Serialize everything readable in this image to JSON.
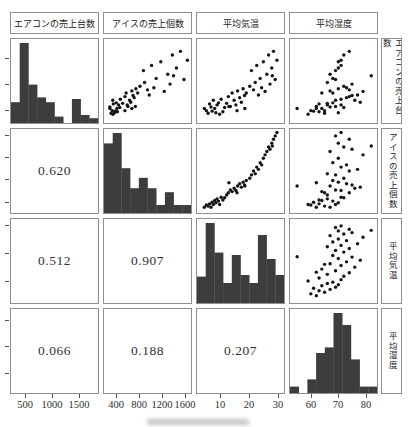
{
  "figure": {
    "background": "#ffffff",
    "border_color": "#8f8f8f",
    "bar_color": "#3d3d3d",
    "point_color": "#151515",
    "text_color": "#2e2e2e"
  },
  "chart_data": {
    "type": "scatter-matrix",
    "description_layout": "4x4 pairs plot: diagonal = histograms, upper triangle = scatter plots, lower triangle = correlation coefficients; column titles boxed on top, row titles boxed on right (vertical text), tick labels on bottom and left ticks",
    "variables": [
      {
        "key": "aircon",
        "label": "エアコンの売上台数",
        "lim": [
          300,
          1800
        ],
        "ticks": [
          500,
          1000,
          1500
        ],
        "hist": [
          0.26,
          1.0,
          0.48,
          0.32,
          0.26,
          0.08,
          0,
          0.3,
          0.1,
          0.06
        ]
      },
      {
        "key": "ice",
        "label": "アイスの売上個数",
        "lim": [
          250,
          1650
        ],
        "ticks": [
          400,
          800,
          1200,
          1600
        ],
        "hist": [
          0.87,
          1.0,
          0.56,
          0.31,
          0.44,
          0.31,
          0.1,
          0.26,
          0.1,
          0.1
        ]
      },
      {
        "key": "temp",
        "label": "平均気温",
        "lim": [
          3,
          31
        ],
        "ticks": [
          10,
          20,
          30
        ],
        "hist": [
          0.33,
          1.0,
          0.63,
          0.25,
          0.6,
          0.35,
          0.25,
          0.85,
          0.55,
          0.35
        ]
      },
      {
        "key": "humidity",
        "label": "平均湿度",
        "lim": [
          53.5,
          83
        ],
        "ticks": [
          60,
          70,
          80
        ],
        "hist": [
          0.08,
          0,
          0.17,
          0.5,
          0.57,
          1.0,
          0.85,
          0.42,
          0.08,
          0.08
        ]
      }
    ],
    "correlations": {
      "1_0": "0.620",
      "2_0": "0.512",
      "2_1": "0.907",
      "3_0": "0.066",
      "3_1": "0.188",
      "3_2": "0.207"
    },
    "observations_columns": [
      "aircon",
      "ice",
      "temp",
      "humidity"
    ],
    "observations": [
      [
        520,
        300,
        4.5,
        62
      ],
      [
        480,
        340,
        5.2,
        60
      ],
      [
        430,
        320,
        5.8,
        65
      ],
      [
        610,
        360,
        6.3,
        63
      ],
      [
        550,
        300,
        6.8,
        67
      ],
      [
        470,
        390,
        7.2,
        61
      ],
      [
        680,
        350,
        7.6,
        69
      ],
      [
        520,
        420,
        8.1,
        64
      ],
      [
        440,
        380,
        8.5,
        70
      ],
      [
        590,
        450,
        8.9,
        66
      ],
      [
        630,
        410,
        9.4,
        68
      ],
      [
        410,
        350,
        9.8,
        59
      ],
      [
        700,
        480,
        10.3,
        71
      ],
      [
        460,
        430,
        10.9,
        63
      ],
      [
        540,
        470,
        11.5,
        72
      ],
      [
        520,
        680,
        18.5,
        55
      ],
      [
        620,
        520,
        12.2,
        66
      ],
      [
        750,
        560,
        12.8,
        74
      ],
      [
        560,
        610,
        13.5,
        69
      ],
      [
        820,
        580,
        14.1,
        64
      ],
      [
        680,
        640,
        14.8,
        76
      ],
      [
        590,
        600,
        15.4,
        71
      ],
      [
        860,
        680,
        16.0,
        67
      ],
      [
        730,
        720,
        16.7,
        73
      ],
      [
        640,
        660,
        17.3,
        78
      ],
      [
        900,
        750,
        17.9,
        70
      ],
      [
        770,
        700,
        18.4,
        75
      ],
      [
        820,
        780,
        19.0,
        68
      ],
      [
        560,
        740,
        13.0,
        62
      ],
      [
        480,
        560,
        15.8,
        65
      ],
      [
        950,
        820,
        20.2,
        72
      ],
      [
        1250,
        880,
        20.8,
        69
      ],
      [
        880,
        950,
        21.5,
        74
      ],
      [
        1020,
        900,
        22.1,
        66
      ],
      [
        1350,
        1020,
        22.6,
        71
      ],
      [
        780,
        980,
        23.2,
        77
      ],
      [
        1100,
        1100,
        23.8,
        68
      ],
      [
        920,
        1060,
        24.3,
        73
      ],
      [
        1420,
        1180,
        24.9,
        70
      ],
      [
        850,
        1240,
        25.5,
        79
      ],
      [
        1180,
        1300,
        26.1,
        67
      ],
      [
        1550,
        1380,
        26.7,
        72
      ],
      [
        990,
        1340,
        27.2,
        75
      ],
      [
        1300,
        1450,
        27.8,
        70
      ],
      [
        1620,
        1520,
        28.4,
        74
      ],
      [
        1080,
        1580,
        29.0,
        69
      ],
      [
        1450,
        1640,
        29.6,
        71
      ],
      [
        1150,
        1400,
        28.0,
        82
      ]
    ]
  }
}
